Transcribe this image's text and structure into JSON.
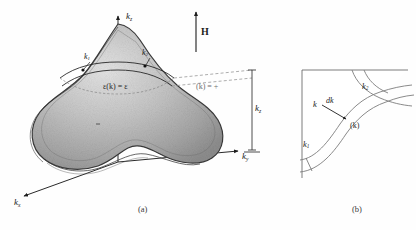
{
  "figure": {
    "panel_a": {
      "caption": "(a)",
      "axes": {
        "kz": "k",
        "kz_sub": "z",
        "ky": "k",
        "ky_sub": "y",
        "kx": "k",
        "kx_sub": "x",
        "kz_side": "k",
        "kz_side_sub": "z"
      },
      "field_label": "H",
      "surface_equation": "ε(k) = ε",
      "orbit_labels": [
        {
          "name": "k",
          "sub": "1"
        },
        {
          "name": "k",
          "sub": "2"
        }
      ],
      "right_annotation": "(k) =  +",
      "surface_name": "constant-energy Fermi surface"
    },
    "panel_b": {
      "caption": "(b)",
      "labels": {
        "k1": "k",
        "k1_sub": "1",
        "k2": "k",
        "k2_sub": "2",
        "k_vector": "k",
        "dk": "dk",
        "k_paren": "(k)"
      }
    },
    "colors": {
      "ink": "#1c1c1c",
      "outline": "#3c3c3c",
      "surface_light": "#d9d9d9",
      "surface_mid": "#b5b5b5",
      "surface_dark": "#8e8e8e",
      "paper": "#fefefe",
      "faint_rule": "#8a8a8a"
    }
  }
}
